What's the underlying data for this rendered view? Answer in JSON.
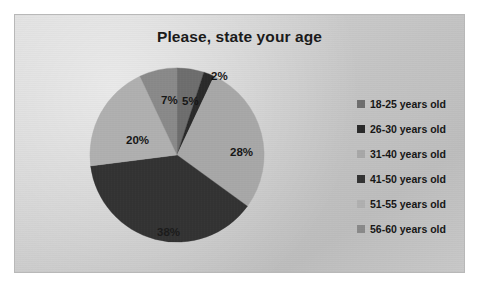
{
  "chart_data": {
    "type": "pie",
    "title": "Please, state your age",
    "categories": [
      "18-25 years old",
      "26-30 years old",
      "31-40 years old",
      "41-50 years old",
      "51-55 years old",
      "56-60 years old"
    ],
    "values": [
      5,
      2,
      28,
      38,
      20,
      7
    ],
    "data_labels": [
      "5%",
      "2%",
      "28%",
      "38%",
      "20%",
      "7%"
    ],
    "colors": [
      "#6e6e6e",
      "#2a2a2a",
      "#a8a8a8",
      "#333333",
      "#b0b0b0",
      "#8a8a8a"
    ],
    "legend_position": "right",
    "grid": false,
    "xlabel": "",
    "ylabel": ""
  },
  "chart": {
    "title": "Please, state your age",
    "background_color": "#c9c9c9",
    "border_color": "#b8b8b8"
  },
  "legend": {
    "items": [
      {
        "label": "18-25 years old",
        "color": "#6e6e6e"
      },
      {
        "label": "26-30 years old",
        "color": "#2a2a2a"
      },
      {
        "label": "31-40 years old",
        "color": "#a8a8a8"
      },
      {
        "label": "41-50 years old",
        "color": "#333333"
      },
      {
        "label": "51-55 years old",
        "color": "#b0b0b0"
      },
      {
        "label": "56-60 years old",
        "color": "#8a8a8a"
      }
    ]
  },
  "labels": {
    "s0": "5%",
    "s1": "2%",
    "s2": "28%",
    "s3": "38%",
    "s4": "20%",
    "s5": "7%"
  }
}
